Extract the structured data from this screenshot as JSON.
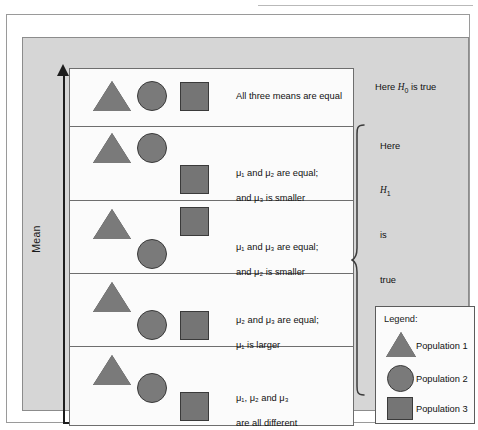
{
  "figure": {
    "axis_label": "Mean",
    "rows": [
      {
        "id": "row-h0",
        "description": "All three means are equal",
        "shapes": [
          "triangle",
          "circle",
          "square"
        ]
      },
      {
        "id": "row-mu1-mu2-equal",
        "description_line1": "μ₁ and μ₂ are equal;",
        "description_line2": "and μ₃ is smaller",
        "shapes": [
          "triangle",
          "circle",
          "square"
        ]
      },
      {
        "id": "row-mu1-mu3-equal",
        "description_line1": "μ₁ and μ₃ are equal;",
        "description_line2": "and μ₂ is smaller",
        "shapes": [
          "triangle",
          "square",
          "circle"
        ]
      },
      {
        "id": "row-mu2-mu3-equal",
        "description_line1": "μ₂ and μ₃ are equal;",
        "description_line2": "μ₁ is larger",
        "shapes": [
          "triangle",
          "circle",
          "square"
        ]
      },
      {
        "id": "row-all-different",
        "description_line1": "μ₁, μ₂ and μ₃",
        "description_line2": "are all different",
        "shapes": [
          "triangle",
          "circle",
          "square"
        ]
      }
    ],
    "annotations": {
      "h0_label_prefix": "Here ",
      "h0_symbol": "H",
      "h0_subscript": "0",
      "h0_label_suffix": " is true",
      "h1_stack": [
        "Here",
        "H₁",
        "is",
        "true"
      ],
      "h1_word_1": "Here",
      "h1_symbol": "H",
      "h1_subscript": "1",
      "h1_word_3": "is",
      "h1_word_4": "true"
    },
    "legend": {
      "title": "Legend:",
      "items": [
        {
          "shape": "triangle",
          "label": "Population 1"
        },
        {
          "shape": "circle",
          "label": "Population 2"
        },
        {
          "shape": "square",
          "label": "Population 3"
        }
      ]
    },
    "colors": {
      "panel_background": "#d6d6d6",
      "rows_background": "#fbfbfb",
      "shape_fill": "#7a7a7a",
      "shape_stroke": "#3a3a3a",
      "line": "#6e6e6e",
      "text": "#111111"
    }
  }
}
